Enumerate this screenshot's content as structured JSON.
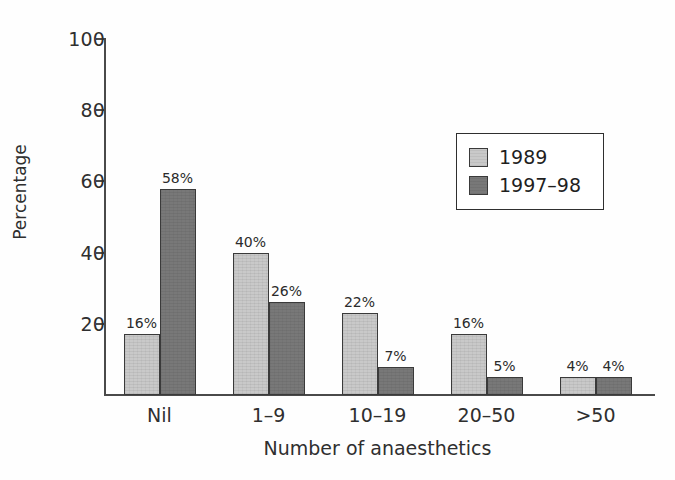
{
  "chart_data": {
    "type": "bar",
    "title": "",
    "xlabel": "Number of anaesthetics",
    "ylabel": "Percentage",
    "categories": [
      "Nil",
      "1–9",
      "10–19",
      "20–50",
      ">50"
    ],
    "ylim": [
      0,
      100
    ],
    "yticks": [
      20,
      40,
      60,
      80,
      100
    ],
    "ytick_labels": [
      "20",
      "40",
      "60",
      "80",
      "100"
    ],
    "grid": false,
    "legend_position": "upper-right",
    "series": [
      {
        "name": "1989",
        "color": "#c9c9c9",
        "values": [
          16,
          40,
          22,
          16,
          4
        ],
        "drawn_values": [
          17,
          40,
          23,
          17,
          5
        ],
        "labels": [
          "16%",
          "40%",
          "22%",
          "16%",
          "4%"
        ]
      },
      {
        "name": "1997–98",
        "color": "#787878",
        "values": [
          58,
          26,
          7,
          5,
          4
        ],
        "drawn_values": [
          58,
          26,
          8,
          5,
          5
        ],
        "labels": [
          "58%",
          "26%",
          "7%",
          "5%",
          "4%"
        ]
      }
    ]
  },
  "legend": {
    "entries": [
      {
        "label": "1989"
      },
      {
        "label": "1997–98"
      }
    ]
  },
  "colors": {
    "series_1989": "#c9c9c9",
    "series_1997_98": "#787878",
    "axis": "#4a4a4a",
    "text": "#2f2f2f",
    "bar_outline": "#3a3a3a",
    "background": "#ffffff"
  }
}
